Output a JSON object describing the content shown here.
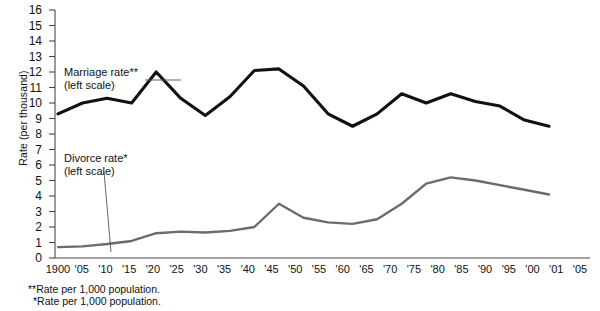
{
  "chart_data": {
    "type": "line",
    "title": "",
    "xlabel": "",
    "ylabel": "Rate (per thousand)",
    "ylim": [
      0,
      16
    ],
    "yticks": [
      0,
      1,
      2,
      3,
      4,
      5,
      6,
      7,
      8,
      9,
      10,
      11,
      12,
      13,
      14,
      15,
      16
    ],
    "grid": false,
    "legend_position": "inline-annotations",
    "x_tick_labels": [
      "1900",
      "'05",
      "'10",
      "'15",
      "'20",
      "'25",
      "'30",
      "'35",
      "'40",
      "'45",
      "'50",
      "'55",
      "'60",
      "'65",
      "'70",
      "'75",
      "'80",
      "'85",
      "'90",
      "'95",
      "'00",
      "'01",
      "'05"
    ],
    "x": [
      1900,
      1905,
      1910,
      1915,
      1920,
      1925,
      1930,
      1935,
      1940,
      1945,
      1950,
      1955,
      1960,
      1965,
      1970,
      1975,
      1980,
      1985,
      1990,
      1995,
      2000
    ],
    "series": [
      {
        "name": "Marriage rate**",
        "sublabel": "(left scale)",
        "color": "#111111",
        "values": [
          9.3,
          10.0,
          10.3,
          10.0,
          12.0,
          10.3,
          9.2,
          10.4,
          12.1,
          12.2,
          11.1,
          9.3,
          8.5,
          9.3,
          10.6,
          10.0,
          10.6,
          10.1,
          9.8,
          8.9,
          8.5
        ]
      },
      {
        "name": "Divorce rate*",
        "sublabel": "(left scale)",
        "color": "#6b6b6b",
        "values": [
          0.7,
          0.75,
          0.9,
          1.1,
          1.6,
          1.7,
          1.65,
          1.75,
          2.0,
          3.5,
          2.6,
          2.3,
          2.2,
          2.5,
          3.5,
          4.8,
          5.2,
          5.0,
          4.7,
          4.4,
          4.1
        ]
      }
    ],
    "annotations": [
      {
        "text": "Marriage rate**",
        "sub": "(left scale)"
      },
      {
        "text": "Divorce rate*",
        "sub": "(left scale)"
      }
    ],
    "footnotes": [
      "** Rate per 1,000 population.",
      "* Rate per 1,000 population."
    ]
  },
  "axis": {
    "y_title": "Rate (per thousand)"
  },
  "legend": {
    "marriage_label": "Marriage rate**",
    "marriage_sub": "(left scale)",
    "divorce_label": "Divorce rate*",
    "divorce_sub": "(left scale)"
  },
  "footnotes": {
    "line1_marker": "**",
    "line1_text": "Rate per 1,000 population.",
    "line2_marker": "*",
    "line2_text": "Rate per 1,000 population."
  }
}
